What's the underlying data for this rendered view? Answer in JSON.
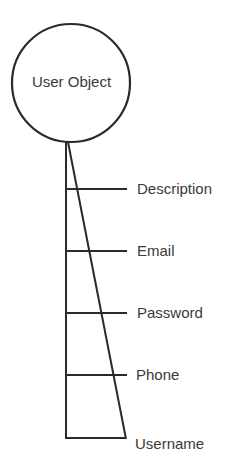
{
  "diagram": {
    "root": {
      "label": "User Object"
    },
    "attributes": [
      {
        "label": "Description"
      },
      {
        "label": "Email"
      },
      {
        "label": "Password"
      },
      {
        "label": "Phone"
      },
      {
        "label": "Username"
      }
    ],
    "colors": {
      "stroke": "#2a2a2a",
      "text": "#3a3a3a",
      "background": "#ffffff"
    }
  }
}
